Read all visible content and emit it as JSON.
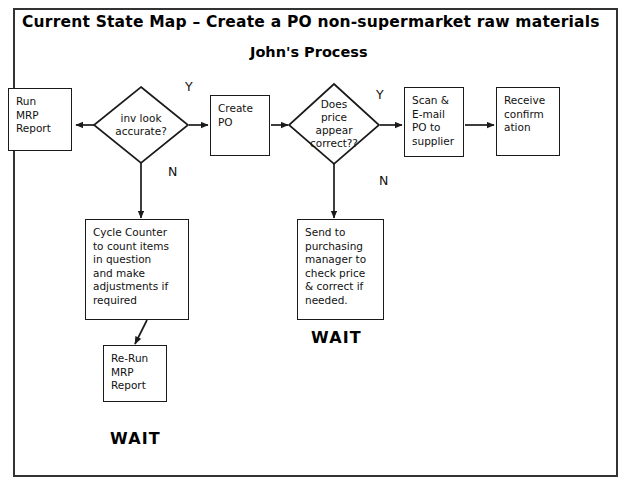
{
  "page": {
    "title": "Current State Map – Create a PO non-supermarket raw materials",
    "subtitle": "John's  Process"
  },
  "nodes": {
    "run_mrp": {
      "label": "Run\nMRP\nReport",
      "type": "process"
    },
    "inv_check": {
      "label": "inv look\naccurate?",
      "type": "decision"
    },
    "create_po": {
      "label": "Create\nPO",
      "type": "process"
    },
    "price_check": {
      "label": "Does\nprice\nappear\ncorrect??",
      "type": "decision"
    },
    "scan_email": {
      "label": "Scan &\nE-mail\nPO to\nsupplier",
      "type": "process"
    },
    "receive_confirmation": {
      "label": "Receive\nconfirm\nation",
      "type": "process"
    },
    "cycle_counter": {
      "label": "Cycle Counter\nto count items\nin question\nand make\nadjustments if\nrequired",
      "type": "process"
    },
    "rerun_mrp": {
      "label": "Re-Run\nMRP\nReport",
      "type": "process"
    },
    "send_purchasing": {
      "label": "Send to\npurchasing\nmanager to\ncheck price\n& correct if\nneeded.",
      "type": "process"
    }
  },
  "branch_labels": {
    "inv_yes": "Y",
    "inv_no": "N",
    "price_yes": "Y",
    "price_no": "N"
  },
  "annotations": {
    "wait_price": "WAIT",
    "wait_inventory": "WAIT"
  },
  "colors": {
    "stroke": "#1a1a1a",
    "frame": "#333333",
    "text": "#111111",
    "background": "#ffffff"
  }
}
